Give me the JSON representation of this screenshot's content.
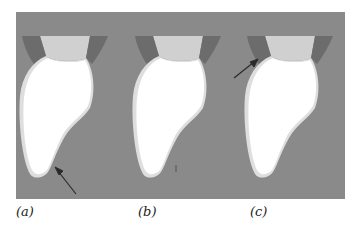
{
  "figure": {
    "background_color": "#8a8a8a",
    "tooth_color": "#ffffff",
    "tooth_edge_color": "#dcdcdc",
    "band_color": "#cfcfcf",
    "gum_color": "#6e6e6e",
    "arrow_color": "#2a2a2a",
    "panels": [
      {
        "id": "a",
        "label": "(a)",
        "arrow": "tip-bottom-right"
      },
      {
        "id": "b",
        "label": "(b)",
        "arrow": "none"
      },
      {
        "id": "c",
        "label": "(c)",
        "arrow": "top-left-neck"
      }
    ]
  }
}
